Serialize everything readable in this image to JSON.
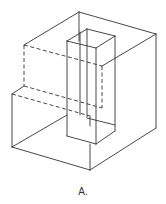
{
  "figure": {
    "caption": "A.",
    "line_color": "#333333",
    "solid_edges": [
      [
        79,
        12,
        156,
        34
      ],
      [
        79,
        12,
        24,
        45
      ],
      [
        79,
        12,
        79,
        41
      ],
      [
        156,
        34,
        156,
        128
      ],
      [
        156,
        34,
        102,
        66
      ],
      [
        12,
        94,
        12,
        147
      ],
      [
        12,
        94,
        24,
        86
      ],
      [
        12,
        147,
        90,
        170
      ],
      [
        90,
        170,
        156,
        128
      ],
      [
        90,
        170,
        90,
        144
      ],
      [
        12,
        147,
        67,
        115
      ],
      [
        67,
        41,
        87,
        29
      ],
      [
        87,
        29,
        115,
        36
      ],
      [
        115,
        36,
        96,
        48
      ],
      [
        96,
        48,
        67,
        41
      ],
      [
        67,
        41,
        67,
        136
      ],
      [
        96,
        48,
        96,
        144
      ],
      [
        115,
        36,
        115,
        131
      ],
      [
        87,
        29,
        87,
        117
      ],
      [
        80,
        32,
        80,
        115
      ],
      [
        67,
        136,
        96,
        144
      ],
      [
        96,
        144,
        115,
        131
      ],
      [
        90,
        116,
        90,
        126
      ],
      [
        87,
        118,
        115,
        125
      ]
    ],
    "dashed_edges": [
      [
        24,
        45,
        102,
        66
      ],
      [
        24,
        45,
        24,
        86
      ],
      [
        102,
        66,
        102,
        108
      ],
      [
        24,
        86,
        102,
        108
      ],
      [
        12,
        94,
        90,
        116
      ]
    ]
  }
}
